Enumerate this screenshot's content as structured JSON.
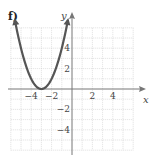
{
  "panel_label": "f)",
  "chart_data": {
    "type": "line",
    "title": "f)",
    "xlabel": "x",
    "ylabel": "y",
    "xlim": [
      -6,
      6
    ],
    "ylim": [
      -6,
      6
    ],
    "grid": true,
    "x_ticks": [
      -4,
      -2,
      2,
      4
    ],
    "x_tick_labels": [
      "−4",
      "−2",
      "2",
      "4"
    ],
    "y_ticks": [
      4,
      2,
      -2,
      -4
    ],
    "y_tick_labels": [
      "4",
      "2",
      "−2",
      "−4"
    ],
    "series": [
      {
        "name": "y = (x + 3)^2",
        "description": "Upward-opening parabola with vertex at (-3, 0), arrows on both ends",
        "vertex": [
          -3,
          0
        ],
        "x": [
          -5.6,
          -5,
          -4,
          -3,
          -2,
          -1,
          -0.4
        ],
        "y": [
          6.0,
          4,
          1,
          0,
          1,
          4,
          6.0
        ],
        "color": "#555555"
      }
    ]
  }
}
